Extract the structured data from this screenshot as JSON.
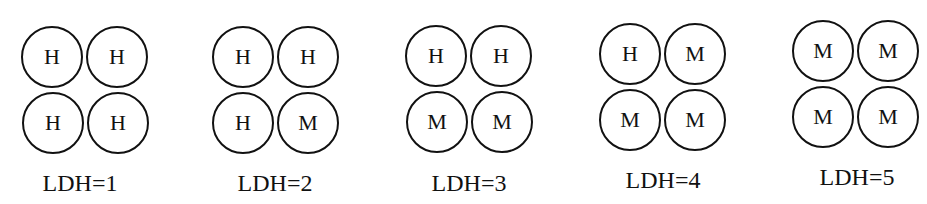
{
  "isozymes": [
    {
      "label": "LDH=1",
      "subunits": [
        "H",
        "H",
        "H",
        "H"
      ]
    },
    {
      "label": "LDH=2",
      "subunits": [
        "H",
        "H",
        "H",
        "M"
      ]
    },
    {
      "label": "LDH=3",
      "subunits": [
        "H",
        "H",
        "M",
        "M"
      ]
    },
    {
      "label": "LDH=4",
      "subunits": [
        "H",
        "M",
        "M",
        "M"
      ]
    },
    {
      "label": "LDH=5",
      "subunits": [
        "M",
        "M",
        "M",
        "M"
      ]
    }
  ]
}
